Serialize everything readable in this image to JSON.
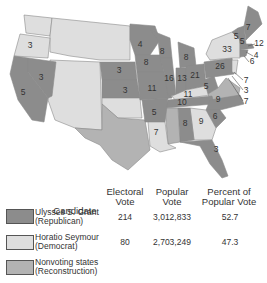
{
  "colors": {
    "republican": "#8c8c8c",
    "democrat": "#dedede",
    "nonvoting": "#b3b3b3",
    "border": "#8a8a8a",
    "text": "#333333"
  },
  "map": {
    "state_labels": [
      {
        "state": "Oregon",
        "votes": "3"
      },
      {
        "state": "California",
        "votes": "5"
      },
      {
        "state": "Nevada",
        "votes": "3"
      },
      {
        "state": "Nebraska",
        "votes": "3"
      },
      {
        "state": "Kansas",
        "votes": "3"
      },
      {
        "state": "Minnesota",
        "votes": "4"
      },
      {
        "state": "Iowa",
        "votes": "8"
      },
      {
        "state": "Missouri",
        "votes": "11"
      },
      {
        "state": "Wisconsin",
        "votes": "8"
      },
      {
        "state": "Michigan",
        "votes": "8"
      },
      {
        "state": "Illinois",
        "votes": "16"
      },
      {
        "state": "Indiana",
        "votes": "13"
      },
      {
        "state": "Ohio",
        "votes": "21"
      },
      {
        "state": "Kentucky",
        "votes": "11"
      },
      {
        "state": "West Virginia",
        "votes": "5"
      },
      {
        "state": "Pennsylvania",
        "votes": "26"
      },
      {
        "state": "New York",
        "votes": "33"
      },
      {
        "state": "Vermont",
        "votes": "5"
      },
      {
        "state": "New Hampshire",
        "votes": "5"
      },
      {
        "state": "Maine",
        "votes": "7"
      },
      {
        "state": "Massachusetts",
        "votes": "12"
      },
      {
        "state": "Rhode Island",
        "votes": "4"
      },
      {
        "state": "Connecticut",
        "votes": "6"
      },
      {
        "state": "New Jersey",
        "votes": "7"
      },
      {
        "state": "Delaware",
        "votes": "3"
      },
      {
        "state": "Maryland",
        "votes": "7"
      },
      {
        "state": "Tennessee",
        "votes": "10"
      },
      {
        "state": "North Carolina",
        "votes": "9"
      },
      {
        "state": "South Carolina",
        "votes": "6"
      },
      {
        "state": "Georgia",
        "votes": "9"
      },
      {
        "state": "Alabama",
        "votes": "8"
      },
      {
        "state": "Arkansas",
        "votes": "5"
      },
      {
        "state": "Louisiana",
        "votes": "7"
      },
      {
        "state": "Florida",
        "votes": "3"
      }
    ]
  },
  "legend": {
    "headers": {
      "candidate": "Candidate",
      "electoral_1": "Electoral",
      "electoral_2": "Vote",
      "popular_1": "Popular",
      "popular_2": "Vote",
      "percent_1": "Percent of",
      "percent_2": "Popular Vote"
    },
    "rows": [
      {
        "name": "Ulysses S. Grant",
        "party": "(Republican)",
        "electoral": "214",
        "popular": "3,012,833",
        "percent": "52.7"
      },
      {
        "name": "Horatio Seymour",
        "party": "(Democrat)",
        "electoral": "80",
        "popular": "2,703,249",
        "percent": "47.3"
      },
      {
        "name": "Nonvoting states",
        "party": "(Reconstruction)",
        "electoral": "",
        "popular": "",
        "percent": ""
      }
    ]
  }
}
